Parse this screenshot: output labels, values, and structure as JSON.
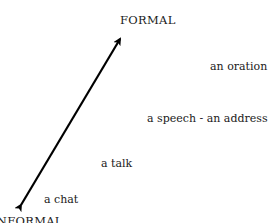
{
  "diagram": {
    "axis": {
      "top_label": "FORMAL",
      "bottom_label": "INFORMAL",
      "arrow": {
        "style": "double-headed",
        "from": [
          19,
          208
        ],
        "to": [
          122,
          36
        ],
        "color": "#000000"
      }
    },
    "items": [
      {
        "label": "an oration",
        "x": 210,
        "y": 60
      },
      {
        "label": "a speech - an address",
        "x": 147,
        "y": 113
      },
      {
        "label": "a talk",
        "x": 101,
        "y": 158
      },
      {
        "label": "a chat",
        "x": 44,
        "y": 194
      }
    ]
  }
}
